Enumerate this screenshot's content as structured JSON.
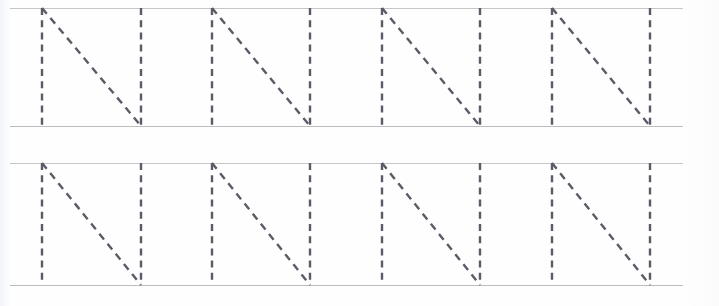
{
  "worksheet": {
    "title": "Letter N tracing practice worksheet",
    "letter": "N",
    "paper_color": "#fefeff",
    "rule_color": "#c6c6c8",
    "trace_color": "#5b5b67",
    "width": 719,
    "height": 306,
    "rows": [
      {
        "name": "row-1",
        "top_rule_y": 8,
        "baseline_y": 126,
        "rule_start_x": 10,
        "rule_end_x": 683,
        "letters": [
          {
            "name": "letter-n-1",
            "character": "N",
            "left_x": 41,
            "width": 101
          },
          {
            "name": "letter-n-2",
            "character": "N",
            "left_x": 211,
            "width": 100
          },
          {
            "name": "letter-n-3",
            "character": "N",
            "left_x": 381,
            "width": 100
          },
          {
            "name": "letter-n-4",
            "character": "N",
            "left_x": 551,
            "width": 100
          }
        ]
      },
      {
        "name": "row-2",
        "top_rule_y": 163,
        "baseline_y": 285,
        "rule_start_x": 10,
        "rule_end_x": 683,
        "letters": [
          {
            "name": "letter-n-5",
            "character": "N",
            "left_x": 41,
            "width": 101
          },
          {
            "name": "letter-n-6",
            "character": "N",
            "left_x": 211,
            "width": 100
          },
          {
            "name": "letter-n-7",
            "character": "N",
            "left_x": 381,
            "width": 100
          },
          {
            "name": "letter-n-8",
            "character": "N",
            "left_x": 551,
            "width": 100
          }
        ]
      }
    ]
  }
}
